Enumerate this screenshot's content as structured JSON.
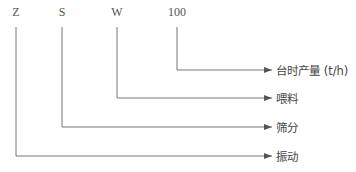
{
  "codes": [
    {
      "text": "Z",
      "x": 16
    },
    {
      "text": "S",
      "x": 62
    },
    {
      "text": "W",
      "x": 117
    },
    {
      "text": "100",
      "x": 177
    }
  ],
  "labels": [
    {
      "text": "台时产量 (t/h)",
      "y": 70
    },
    {
      "text": "喂料",
      "y": 98
    },
    {
      "text": "筛分",
      "y": 127
    },
    {
      "text": "振动",
      "y": 156
    }
  ],
  "line_color": "#777777"
}
